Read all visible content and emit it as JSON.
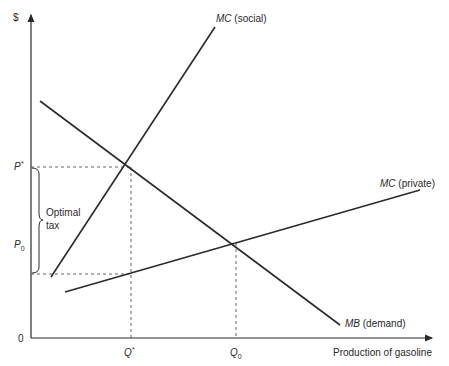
{
  "diagram": {
    "y_axis": {
      "label": "$",
      "origin_label": "0"
    },
    "x_axis": {
      "label": "Production of gasoline"
    },
    "price_labels": {
      "p_star": "P*",
      "p_star_main": "P",
      "p_star_sup": "*",
      "p0_main": "P",
      "p0_sub": "0"
    },
    "quantity_labels": {
      "q_star_main": "Q",
      "q_star_sup": "*",
      "q0_main": "Q",
      "q0_sub": "0"
    },
    "brace_label": {
      "line1": "Optimal",
      "line2": "tax"
    },
    "curves": [
      {
        "name": "MC (social)",
        "italic": "MC",
        "plain": " (social)",
        "from": [
          51,
          277
        ],
        "to": [
          215,
          27
        ]
      },
      {
        "name": "MC (private)",
        "italic": "MC",
        "plain": " (private)",
        "from": [
          65,
          292
        ],
        "to": [
          420,
          190
        ]
      },
      {
        "name": "MB (demand)",
        "italic": "MB",
        "plain": " (demand)",
        "from": [
          40,
          101
        ],
        "to": [
          340,
          325
        ]
      }
    ],
    "points": {
      "optimum": {
        "x": 131,
        "y": 167
      },
      "market": {
        "x": 236,
        "y": 243
      },
      "tax_low": {
        "y": 274
      }
    },
    "colors": {
      "line": "#2a2a2a",
      "dash": "#555555",
      "background": "#ffffff"
    }
  }
}
